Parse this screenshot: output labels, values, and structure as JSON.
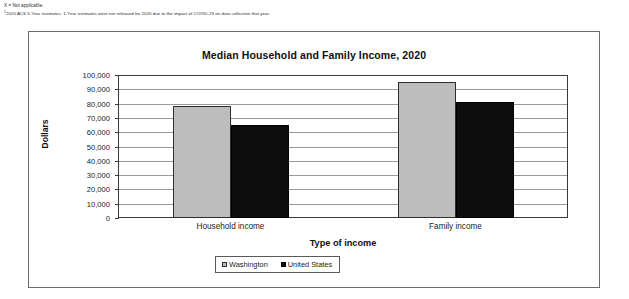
{
  "footnotes": [
    "X = Not applicable.",
    "2020 ACS 5-Year estimates. 1-Year estimates were not released for 2020 due to the impact of COVID-19 on data collection that year."
  ],
  "footnote_marker": "1",
  "chart_data": {
    "type": "bar",
    "title": "Median Household and Family Income, 2020",
    "xlabel": "Type of income",
    "ylabel": "Dollars",
    "categories": [
      "Household income",
      "Family income"
    ],
    "series": [
      {
        "name": "Washington",
        "values": [
          78000,
          95000
        ],
        "color": "#bdbdbd"
      },
      {
        "name": "United States",
        "values": [
          65000,
          81000
        ],
        "color": "#0d0d0d"
      }
    ],
    "ylim": [
      0,
      100000
    ],
    "ytick_values": [
      0,
      10000,
      20000,
      30000,
      40000,
      50000,
      60000,
      70000,
      80000,
      90000,
      100000
    ],
    "ytick_labels": [
      "0",
      "10,000",
      "20,000",
      "30,000",
      "40,000",
      "50,000",
      "60,000",
      "70,000",
      "80,000",
      "90,000",
      "100,000"
    ],
    "grid": true,
    "legend_position": "bottom"
  }
}
